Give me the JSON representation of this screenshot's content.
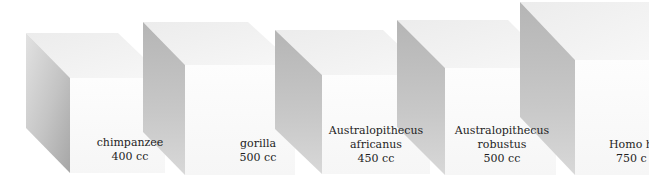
{
  "figure": {
    "cubes": [
      {
        "name": "chimpanzee",
        "volume": "400 cc"
      },
      {
        "name": "gorilla",
        "volume": "500 cc"
      },
      {
        "name_line1": "Australopithecus",
        "name_line2": "africanus",
        "volume": "450 cc"
      },
      {
        "name_line1": "Australopithecus",
        "name_line2": "robustus",
        "volume": "500 cc"
      },
      {
        "name": "Homo ha",
        "volume": "750 c"
      }
    ]
  },
  "colors": {
    "background": "#ffffff",
    "front_face": "#fbfbfb",
    "top_face": "#eeeeee",
    "side_face_light": "#d6d6d6",
    "side_face_dark": "#a9a9a9",
    "text": "#1e1e1e"
  }
}
